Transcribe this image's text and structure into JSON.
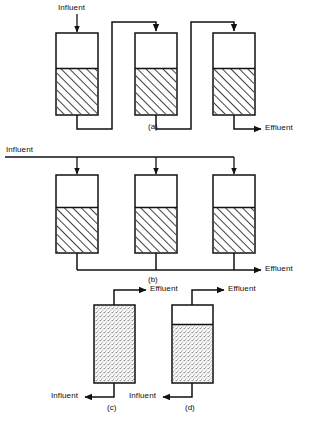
{
  "figure": {
    "type": "process-flow-diagram",
    "stroke_color": "#111111",
    "hatch_color": "#111111",
    "stipple_color": "#8a8a8a",
    "background": "#ffffff"
  },
  "panels": [
    {
      "id": "a",
      "caption": "(a)",
      "arrangement": "series",
      "tank_count": 3,
      "fill": "hatch",
      "inlet_label": "Influent",
      "outlet_label": "Effluent"
    },
    {
      "id": "b",
      "caption": "(b)",
      "arrangement": "parallel",
      "tank_count": 3,
      "fill": "hatch",
      "inlet_label": "Influent",
      "outlet_label": "Effluent"
    },
    {
      "id": "c",
      "caption": "(c)",
      "arrangement": "upflow-full-bed",
      "tank_count": 1,
      "fill": "stipple",
      "inlet_label": "Influent",
      "outlet_label": "Effluent"
    },
    {
      "id": "d",
      "caption": "(d)",
      "arrangement": "upflow-with-headspace",
      "tank_count": 1,
      "fill": "stipple",
      "inlet_label": "Influent",
      "outlet_label": "Effluent"
    }
  ],
  "labels": {
    "influent_a": "Influent",
    "effluent_a": "Effluent",
    "caption_a": "(a)",
    "influent_b": "Influent",
    "effluent_b": "Effluent",
    "caption_b": "(b)",
    "effluent_c": "Effluent",
    "influent_c": "Influent",
    "caption_c": "(c)",
    "effluent_d": "Effluent",
    "influent_d": "Influent",
    "caption_d": "(d)"
  }
}
